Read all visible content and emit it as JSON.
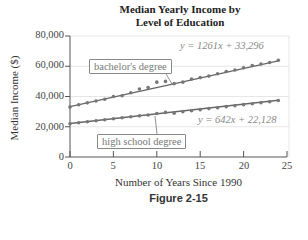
{
  "chart_data": {
    "type": "scatter",
    "title_lines": [
      "Median Yearly Income by",
      "Level of Education"
    ],
    "xlabel": "Number of Years Since 1990",
    "ylabel": "Median Income ($)",
    "xlim": [
      0,
      25
    ],
    "ylim": [
      0,
      80000
    ],
    "x_ticks": [
      "0",
      "5",
      "10",
      "15",
      "20",
      "25"
    ],
    "y_ticks": [
      "0",
      "20,000",
      "40,000",
      "60,000",
      "80,000"
    ],
    "grid": true,
    "caption": "Figure 2-15",
    "series": [
      {
        "name": "bachelor's degree",
        "trendline": "y = 1261x + 33,296",
        "slope": 1261,
        "intercept": 33296,
        "x": [
          0,
          1,
          2,
          3,
          4,
          5,
          6,
          7,
          8,
          9,
          10,
          11,
          12,
          13,
          14,
          15,
          16,
          17,
          18,
          19,
          20,
          21,
          22,
          23,
          24
        ],
        "values": [
          33000,
          34500,
          35800,
          37000,
          38200,
          40000,
          40500,
          42500,
          45000,
          46000,
          49500,
          50000,
          48500,
          49500,
          51500,
          52500,
          53500,
          55000,
          56500,
          57500,
          59000,
          60500,
          61500,
          62500,
          64000
        ]
      },
      {
        "name": "high school degree",
        "trendline": "y = 642x + 22,128",
        "slope": 642,
        "intercept": 22128,
        "x": [
          0,
          1,
          2,
          3,
          4,
          5,
          6,
          7,
          8,
          9,
          10,
          11,
          12,
          13,
          14,
          15,
          16,
          17,
          18,
          19,
          20,
          21,
          22,
          23,
          24
        ],
        "values": [
          22000,
          22600,
          23300,
          24000,
          24600,
          25300,
          26000,
          26600,
          27200,
          27800,
          28800,
          29500,
          29000,
          30000,
          30600,
          31300,
          32000,
          32600,
          33300,
          33900,
          34600,
          35200,
          35900,
          36500,
          37400
        ]
      }
    ]
  },
  "labels": {
    "bachelor_box": "bachelor's degree",
    "hs_box": "high school degree",
    "bachelor_eq": "y = 1261x + 33,296",
    "hs_eq": "y = 642x + 22,128"
  }
}
